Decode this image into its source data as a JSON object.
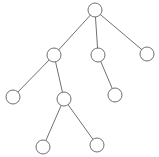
{
  "diagram": {
    "type": "tree",
    "stroke": "#707070",
    "fill": "#ffffff",
    "radius": 7,
    "nodes": [
      {
        "id": "root",
        "x": 95,
        "y": 10
      },
      {
        "id": "a",
        "x": 54,
        "y": 55
      },
      {
        "id": "b",
        "x": 98,
        "y": 55
      },
      {
        "id": "c",
        "x": 147,
        "y": 54
      },
      {
        "id": "d",
        "x": 13,
        "y": 97
      },
      {
        "id": "e",
        "x": 64,
        "y": 99
      },
      {
        "id": "f",
        "x": 115,
        "y": 95
      },
      {
        "id": "g",
        "x": 43,
        "y": 147
      },
      {
        "id": "h",
        "x": 97,
        "y": 145
      }
    ],
    "edges": [
      [
        "root",
        "a"
      ],
      [
        "root",
        "b"
      ],
      [
        "root",
        "c"
      ],
      [
        "a",
        "d"
      ],
      [
        "a",
        "e"
      ],
      [
        "b",
        "f"
      ],
      [
        "e",
        "g"
      ],
      [
        "e",
        "h"
      ]
    ]
  }
}
